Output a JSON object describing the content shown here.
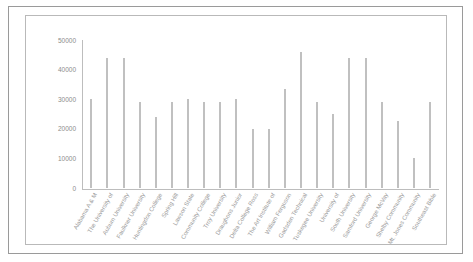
{
  "chart_data": {
    "type": "bar",
    "title": "",
    "xlabel": "",
    "ylabel": "",
    "ylim": [
      0,
      50000
    ],
    "yticks": [
      0,
      10000,
      20000,
      30000,
      40000,
      50000
    ],
    "ytick_labels": [
      "0",
      "10000",
      "20000",
      "30000",
      "40000",
      "50000"
    ],
    "grid": false,
    "legend": false,
    "categories": [
      "Alabama A & M",
      "The University of",
      "Auburn University",
      "Faulkner University",
      "Huntingdon College",
      "Spring Hill",
      "Lawson State",
      "Community College",
      "Troy University",
      "Draughons Junior",
      "Delta College Ross",
      "The Art Institute of",
      "William Ferguson",
      "Gadsden Technical",
      "Tuskegee University",
      "University of",
      "South University",
      "Samford University",
      "George McVay",
      "Shelby Community",
      "Mt. Jones Community",
      "Southeast Bible"
    ],
    "values": [
      30000,
      44000,
      44000,
      29000,
      24000,
      29000,
      30000,
      29000,
      29000,
      30000,
      20000,
      20000,
      33500,
      46000,
      29000,
      25000,
      44000,
      44000,
      29000,
      22500,
      10000,
      29000
    ],
    "bar_color": "#c0c0c0",
    "axis_color": "#bdbdbd",
    "label_color": "#9a9a9a"
  }
}
